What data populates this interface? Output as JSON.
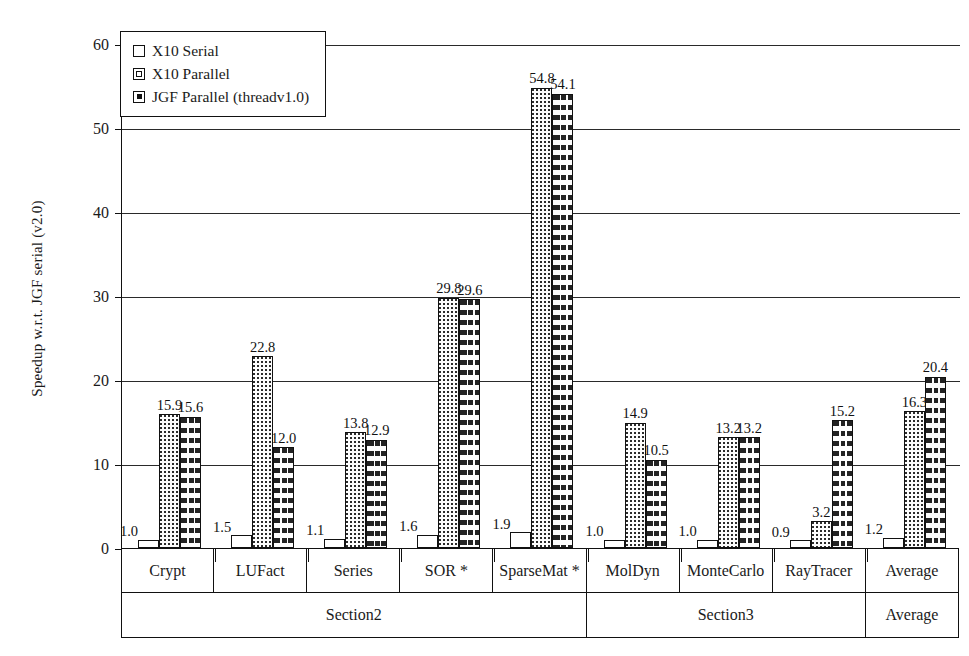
{
  "chart_data": {
    "type": "bar",
    "title": "",
    "xlabel": "",
    "ylabel": "Speedup w.r.t. JGF serial (v2.0)",
    "ylim": [
      0,
      60
    ],
    "yticks": [
      0,
      10,
      20,
      30,
      40,
      50,
      60
    ],
    "grid": true,
    "legend_position": "top-left",
    "categories": [
      "Crypt",
      "LUFact",
      "Series",
      "SOR *",
      "SparseMat *",
      "MolDyn",
      "MonteCarlo",
      "RayTracer",
      "Average"
    ],
    "sections": [
      {
        "label": "Section2",
        "categories": [
          "Crypt",
          "LUFact",
          "Series",
          "SOR *",
          "SparseMat *"
        ]
      },
      {
        "label": "Section3",
        "categories": [
          "MolDyn",
          "MonteCarlo",
          "RayTracer"
        ]
      },
      {
        "label": "Average",
        "categories": [
          ""
        ]
      }
    ],
    "series": [
      {
        "name": "X10 Serial",
        "pattern": "solid-white",
        "values": [
          1.0,
          1.5,
          1.1,
          1.6,
          1.9,
          1.0,
          1.0,
          0.9,
          1.2
        ],
        "labels": [
          "1.0",
          "1.5",
          "1.1",
          "1.6",
          "1.9",
          "1.0",
          "1.0",
          "0.9",
          "1.2"
        ]
      },
      {
        "name": "X10 Parallel",
        "pattern": "dotted",
        "values": [
          15.9,
          22.8,
          13.8,
          29.8,
          54.8,
          14.9,
          13.2,
          3.2,
          16.3
        ],
        "labels": [
          "15.9",
          "22.8",
          "13.8",
          "29.8",
          "54.8",
          "14.9",
          "13.2",
          "3.2",
          "16.3"
        ]
      },
      {
        "name": "JGF Parallel (threadv1.0)",
        "pattern": "vertical-dashed",
        "values": [
          15.6,
          12.0,
          12.9,
          29.6,
          54.1,
          10.5,
          13.2,
          15.2,
          20.4
        ],
        "labels": [
          "15.6",
          "12.0",
          "12.9",
          "29.6",
          "54.1",
          "10.5",
          "13.2",
          "15.2",
          "20.4"
        ]
      }
    ]
  },
  "legend": {
    "items": [
      {
        "label": "X10 Serial",
        "swatch": "legend-swatch-serial"
      },
      {
        "label": "X10 Parallel",
        "swatch": "legend-swatch-parallel"
      },
      {
        "label": "JGF Parallel (threadv1.0)",
        "swatch": "legend-swatch-jgf"
      }
    ]
  },
  "colors": {
    "axis": "#111111",
    "grid": "#2a2a2a",
    "bar_fill": "#ffffff",
    "pattern_ink": "#222222",
    "background": "#ffffff"
  }
}
